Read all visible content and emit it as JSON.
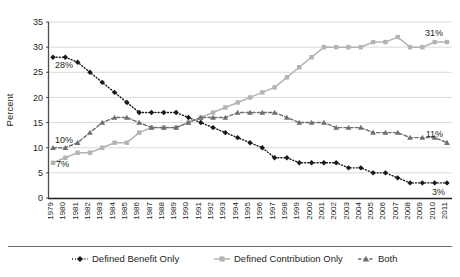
{
  "chart_data": {
    "type": "line",
    "title": "",
    "xlabel": "",
    "ylabel": "Percent",
    "ylim": [
      0,
      35
    ],
    "yticks": [
      0,
      5,
      10,
      15,
      20,
      25,
      30,
      35
    ],
    "grid": true,
    "legend_position": "bottom",
    "x": [
      1979,
      1980,
      1981,
      1982,
      1983,
      1984,
      1985,
      1986,
      1987,
      1988,
      1989,
      1990,
      1991,
      1992,
      1993,
      1994,
      1995,
      1996,
      1997,
      1998,
      1999,
      2000,
      2001,
      2002,
      2003,
      2004,
      2005,
      2006,
      2007,
      2008,
      2009,
      2010,
      2011
    ],
    "categories": [
      "1979",
      "1980",
      "1981",
      "1982",
      "1983",
      "1984",
      "1985",
      "1986",
      "1987",
      "1988",
      "1989",
      "1990",
      "1991",
      "1992",
      "1993",
      "1994",
      "1995",
      "1996",
      "1997",
      "1998",
      "1999",
      "2000",
      "2001",
      "2002",
      "2003",
      "2004",
      "2005",
      "2006",
      "2007",
      "2008",
      "2009",
      "2010",
      "2011"
    ],
    "series": [
      {
        "name": "Defined Benefit Only",
        "color": "#1a1a1a",
        "marker": "diamond",
        "line_style": "dotted",
        "values": [
          28,
          28,
          27,
          25,
          23,
          21,
          19,
          17,
          17,
          17,
          17,
          16,
          15,
          14,
          13,
          12,
          11,
          10,
          8,
          8,
          7,
          7,
          7,
          7,
          6,
          6,
          5,
          5,
          4,
          3,
          3,
          3,
          3
        ]
      },
      {
        "name": "Defined Contribution Only",
        "color": "#b3b3b3",
        "marker": "square",
        "line_style": "solid",
        "values": [
          7,
          8,
          9,
          9,
          10,
          11,
          11,
          13,
          14,
          14,
          14,
          15,
          16,
          17,
          18,
          19,
          20,
          21,
          22,
          24,
          26,
          28,
          30,
          30,
          30,
          30,
          31,
          31,
          32,
          30,
          30,
          31,
          31
        ]
      },
      {
        "name": "Both",
        "color": "#6e6e6e",
        "marker": "triangle",
        "line_style": "dashed",
        "values": [
          10,
          10,
          11,
          13,
          15,
          16,
          16,
          15,
          14,
          14,
          14,
          15,
          16,
          16,
          16,
          17,
          17,
          17,
          17,
          16,
          15,
          15,
          15,
          14,
          14,
          14,
          13,
          13,
          13,
          12,
          12,
          12,
          11
        ]
      }
    ],
    "annotations": [
      {
        "label": "28%",
        "series": "Defined Benefit Only",
        "x": 1979,
        "value": 28,
        "placement": "below-right"
      },
      {
        "label": "3%",
        "series": "Defined Benefit Only",
        "x": 2011,
        "value": 3,
        "placement": "below-left"
      },
      {
        "label": "7%",
        "series": "Defined Contribution Only",
        "x": 1979,
        "value": 7,
        "placement": "right"
      },
      {
        "label": "31%",
        "series": "Defined Contribution Only",
        "x": 2011,
        "value": 31,
        "placement": "above-left"
      },
      {
        "label": "10%",
        "series": "Both",
        "x": 1979,
        "value": 10,
        "placement": "above-right"
      },
      {
        "label": "11%",
        "series": "Both",
        "x": 2011,
        "value": 11,
        "placement": "above-left"
      }
    ]
  },
  "legend": {
    "items": [
      {
        "label": "Defined Benefit Only"
      },
      {
        "label": "Defined Contribution Only"
      },
      {
        "label": "Both"
      }
    ]
  },
  "axes": {
    "y_title": "Percent"
  }
}
